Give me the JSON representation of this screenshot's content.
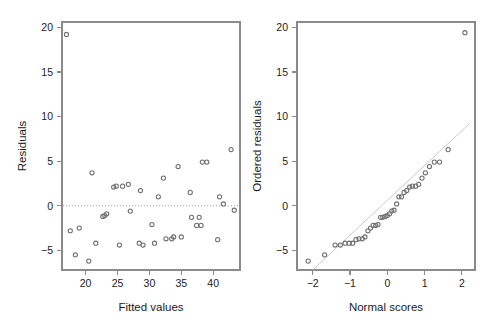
{
  "figure": {
    "width": 500,
    "height": 326,
    "background": "#ffffff",
    "point_color": "#6f6f6f",
    "axis_color": "#8a8a8a",
    "reference_line_color": "#c9c9c9",
    "zero_line_color": "#9a9a9a"
  },
  "chart_data": [
    {
      "type": "scatter",
      "name": "residuals-vs-fitted",
      "title": "",
      "xlabel": "Fitted values",
      "ylabel": "Residuals",
      "xlim": [
        16.3,
        44.2
      ],
      "ylim": [
        -7.2,
        20.6
      ],
      "xticks": [
        20,
        25,
        30,
        35,
        40
      ],
      "yticks": [
        -5,
        0,
        5,
        10,
        15,
        20
      ],
      "xticklabels": [
        "20",
        "25",
        "30",
        "35",
        "40"
      ],
      "yticklabels": [
        "-5",
        "0",
        "5",
        "10",
        "15",
        "20"
      ],
      "grid": false,
      "legend": "none",
      "annotations": [
        {
          "kind": "horizontal-reference-line",
          "y": 0,
          "style": "dotted"
        }
      ],
      "x": [
        17.0,
        17.6,
        18.4,
        19.0,
        20.5,
        21.0,
        21.6,
        22.7,
        23.0,
        23.3,
        24.4,
        24.8,
        25.3,
        25.8,
        26.7,
        27.0,
        28.4,
        28.6,
        29.0,
        30.4,
        30.8,
        31.4,
        32.2,
        32.6,
        33.5,
        33.8,
        34.5,
        35.0,
        36.4,
        36.6,
        37.4,
        37.8,
        38.1,
        38.3,
        39.0,
        40.7,
        41.0,
        41.6,
        42.8,
        43.3
      ],
      "y": [
        19.2,
        -2.8,
        -5.5,
        -2.5,
        -6.2,
        3.7,
        -4.2,
        -1.2,
        -1.1,
        -0.9,
        2.1,
        2.2,
        -4.4,
        2.2,
        2.4,
        -0.6,
        -4.2,
        1.7,
        -4.4,
        -2.1,
        -4.2,
        1.0,
        3.1,
        -3.7,
        -3.7,
        -3.5,
        4.4,
        -3.5,
        1.5,
        -1.3,
        -2.2,
        -1.3,
        -2.2,
        4.9,
        4.9,
        -3.8,
        1.0,
        0.2,
        6.3,
        -0.5
      ]
    },
    {
      "type": "scatter",
      "name": "normal-qq-plot",
      "title": "",
      "xlabel": "Normal scores",
      "ylabel": "Ordered residuals",
      "xlim": [
        -2.42,
        2.35
      ],
      "ylim": [
        -7.2,
        20.6
      ],
      "xticks": [
        -2,
        -1,
        0,
        1,
        2
      ],
      "yticks": [
        -5,
        0,
        5,
        10,
        15,
        20
      ],
      "xticklabels": [
        "-2",
        "-1",
        "0",
        "1",
        "2"
      ],
      "yticklabels": [
        "-5",
        "0",
        "5",
        "10",
        "15",
        "20"
      ],
      "grid": false,
      "legend": "none",
      "annotations": [
        {
          "kind": "qq-reference-line",
          "x0": -2.0,
          "y0": -7.2,
          "x1": 2.2,
          "y1": 9.2,
          "style": "solid-light"
        }
      ],
      "x": [
        -2.12,
        -1.68,
        -1.4,
        -1.26,
        -1.13,
        -1.02,
        -0.93,
        -0.84,
        -0.76,
        -0.67,
        -0.6,
        -0.52,
        -0.45,
        -0.38,
        -0.31,
        -0.25,
        -0.18,
        -0.12,
        -0.06,
        0.0,
        0.06,
        0.12,
        0.18,
        0.25,
        0.31,
        0.38,
        0.45,
        0.52,
        0.6,
        0.67,
        0.76,
        0.84,
        0.93,
        1.02,
        1.13,
        1.26,
        1.4,
        1.63,
        2.08
      ],
      "y": [
        -6.2,
        -5.5,
        -4.4,
        -4.4,
        -4.2,
        -4.2,
        -4.2,
        -3.8,
        -3.7,
        -3.7,
        -3.5,
        -2.8,
        -2.5,
        -2.2,
        -2.2,
        -2.1,
        -1.3,
        -1.3,
        -1.2,
        -1.1,
        -0.9,
        -0.6,
        -0.5,
        0.2,
        1.0,
        1.0,
        1.5,
        1.7,
        2.1,
        2.2,
        2.2,
        2.4,
        3.1,
        3.7,
        4.4,
        4.9,
        4.9,
        6.3,
        19.4
      ]
    }
  ]
}
